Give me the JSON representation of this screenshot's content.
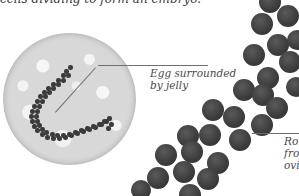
{
  "intro_text": "cells dividing to form an embryo.",
  "labels": {
    "egg_jelly": {
      "line1": "Egg surrounded",
      "line2": "by jelly"
    },
    "row_eggs": {
      "line1": "Row",
      "line2": "from",
      "line3": "ovid"
    }
  },
  "colors": {
    "egg": "#3e3e3e",
    "jelly_background": "#d8d8d8",
    "text": "#4a4a4a"
  },
  "magnified_view": {
    "spawn_dots": [
      [
        66,
        71
      ],
      [
        70,
        67
      ],
      [
        63,
        75
      ],
      [
        68,
        75
      ],
      [
        58,
        80
      ],
      [
        63,
        80
      ],
      [
        53,
        84
      ],
      [
        58,
        84
      ],
      [
        48,
        88
      ],
      [
        53,
        88
      ],
      [
        44,
        92
      ],
      [
        49,
        92
      ],
      [
        40,
        96
      ],
      [
        45,
        96
      ],
      [
        37,
        101
      ],
      [
        42,
        101
      ],
      [
        34,
        106
      ],
      [
        39,
        106
      ],
      [
        32,
        111
      ],
      [
        37,
        111
      ],
      [
        31,
        116
      ],
      [
        36,
        116
      ],
      [
        32,
        121
      ],
      [
        37,
        121
      ],
      [
        34,
        126
      ],
      [
        39,
        125
      ],
      [
        37,
        130
      ],
      [
        42,
        129
      ],
      [
        42,
        134
      ],
      [
        46,
        132
      ],
      [
        47,
        137
      ],
      [
        52,
        134
      ],
      [
        53,
        138
      ],
      [
        57,
        135
      ],
      [
        59,
        138
      ],
      [
        63,
        135
      ],
      [
        65,
        137
      ],
      [
        69,
        134
      ],
      [
        71,
        135
      ],
      [
        75,
        132
      ],
      [
        77,
        133
      ],
      [
        81,
        130
      ],
      [
        83,
        131
      ],
      [
        87,
        128
      ],
      [
        89,
        129
      ],
      [
        93,
        126
      ],
      [
        95,
        127
      ],
      [
        99,
        124
      ],
      [
        101,
        124
      ],
      [
        104,
        121
      ],
      [
        106,
        121
      ],
      [
        109,
        118
      ],
      [
        108,
        128
      ],
      [
        111,
        124
      ]
    ]
  },
  "eggs": [
    [
      270,
      2,
      11
    ],
    [
      262,
      24,
      11
    ],
    [
      288,
      16,
      11
    ],
    [
      278,
      45,
      11
    ],
    [
      297,
      40,
      10
    ],
    [
      254,
      55,
      11
    ],
    [
      290,
      62,
      11
    ],
    [
      268,
      78,
      11
    ],
    [
      244,
      90,
      11
    ],
    [
      263,
      95,
      11
    ],
    [
      296,
      87,
      10
    ],
    [
      277,
      108,
      11
    ],
    [
      213,
      110,
      11
    ],
    [
      234,
      117,
      11
    ],
    [
      262,
      125,
      11
    ],
    [
      188,
      136,
      11
    ],
    [
      210,
      135,
      11
    ],
    [
      240,
      140,
      11
    ],
    [
      166,
      155,
      11
    ],
    [
      192,
      152,
      11
    ],
    [
      218,
      163,
      11
    ],
    [
      158,
      178,
      11
    ],
    [
      184,
      172,
      11
    ],
    [
      208,
      179,
      11
    ],
    [
      190,
      195,
      11
    ],
    [
      141,
      190,
      10
    ]
  ]
}
